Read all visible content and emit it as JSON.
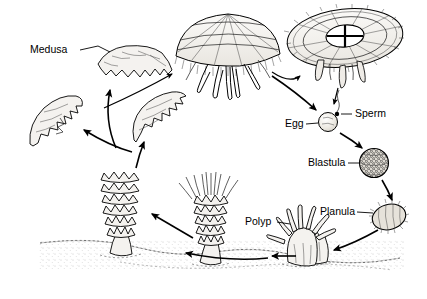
{
  "figure": {
    "background_color": "#ffffff",
    "ink_color": "#000000",
    "width": 427,
    "height": 299
  },
  "labels": {
    "medusa": "Medusa",
    "egg": "Egg",
    "sperm": "Sperm",
    "blastula": "Blastula",
    "planula": "Planula",
    "polyp": "Polyp"
  },
  "stages": [
    {
      "id": "medusa-swimming",
      "label": "Medusa",
      "description": "Free-swimming adult medusa with scalloped bell margin",
      "x": 130,
      "y": 62
    },
    {
      "id": "medusa-side",
      "label": "",
      "description": "Adult medusa side view with oral arms and tentacles",
      "x": 228,
      "y": 45
    },
    {
      "id": "medusa-top",
      "label": "",
      "description": "Adult medusa top view showing cross-shaped gonads",
      "x": 345,
      "y": 38
    },
    {
      "id": "egg",
      "label": "Egg",
      "description": "Pale ovum with sperm attached",
      "x": 328,
      "y": 122
    },
    {
      "id": "sperm",
      "label": "Sperm",
      "description": "Single sperm cell contacting the egg",
      "x": 340,
      "y": 113
    },
    {
      "id": "blastula",
      "label": "Blastula",
      "description": "Hollow ball of cells, textured surface",
      "x": 374,
      "y": 163
    },
    {
      "id": "planula",
      "label": "Planula",
      "description": "Ciliated free-swimming larva",
      "x": 389,
      "y": 217
    },
    {
      "id": "settling-planula",
      "label": "",
      "description": "Settled planula attaching to substrate",
      "x": 312,
      "y": 255
    },
    {
      "id": "polyp",
      "label": "Polyp",
      "description": "Scyphistoma polyp with ring of tentacles",
      "x": 300,
      "y": 250
    },
    {
      "id": "strobila",
      "label": "",
      "description": "Strobila: stacked segmenting discs on stalk",
      "x": 210,
      "y": 220
    },
    {
      "id": "strobila-left",
      "label": "",
      "description": "Strobila releasing ephyrae",
      "x": 120,
      "y": 210
    },
    {
      "id": "ephyra",
      "label": "",
      "description": "Newly released ephyra larva",
      "x": 158,
      "y": 115
    },
    {
      "id": "juvenile-medusa",
      "label": "",
      "description": "Growing juvenile medusa",
      "x": 62,
      "y": 115
    }
  ],
  "flow": [
    {
      "from": "medusa-side",
      "to": "medusa-top"
    },
    {
      "from": "medusa-side",
      "to": "egg"
    },
    {
      "from": "medusa-top",
      "to": "egg"
    },
    {
      "from": "egg",
      "to": "blastula"
    },
    {
      "from": "blastula",
      "to": "planula"
    },
    {
      "from": "planula",
      "to": "settling-planula"
    },
    {
      "from": "settling-planula",
      "to": "polyp"
    },
    {
      "from": "polyp",
      "to": "strobila"
    },
    {
      "from": "strobila",
      "to": "strobila-left"
    },
    {
      "from": "strobila-left",
      "to": "ephyra"
    },
    {
      "from": "ephyra",
      "to": "juvenile-medusa"
    },
    {
      "from": "ephyra",
      "to": "medusa-swimming"
    },
    {
      "from": "juvenile-medusa",
      "to": "medusa-side"
    }
  ]
}
